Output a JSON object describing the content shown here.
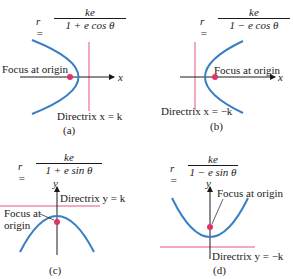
{
  "colors": {
    "curve": "#3a7fc4",
    "directrix": "#e0577a",
    "focus": "#e0336a",
    "axis": "#1a1a1a"
  },
  "panels": [
    {
      "id": "a",
      "equation": {
        "lhs": "r =",
        "numerator": "ke",
        "denominator": "1 + e cos θ"
      },
      "focus_label": "Focus at origin",
      "directrix_label": "Directrix x = k",
      "axis_label": "x",
      "caption": "(a)"
    },
    {
      "id": "b",
      "equation": {
        "lhs": "r =",
        "numerator": "ke",
        "denominator": "1 − e cos θ"
      },
      "focus_label": "Focus at origin",
      "directrix_label": "Directrix x = −k",
      "axis_label": "x",
      "caption": "(b)"
    },
    {
      "id": "c",
      "equation": {
        "lhs": "r =",
        "numerator": "ke",
        "denominator": "1 + e sin θ"
      },
      "focus_label_line1": "Focus at",
      "focus_label_line2": "origin",
      "directrix_label": "Directrix y = k",
      "axis_label": "y",
      "caption": "(c)"
    },
    {
      "id": "d",
      "equation": {
        "lhs": "r =",
        "numerator": "ke",
        "denominator": "1 − e sin θ"
      },
      "focus_label": "Focus at origin",
      "directrix_label": "Directrix y = −k",
      "axis_label": "y",
      "caption": "(d)"
    }
  ]
}
